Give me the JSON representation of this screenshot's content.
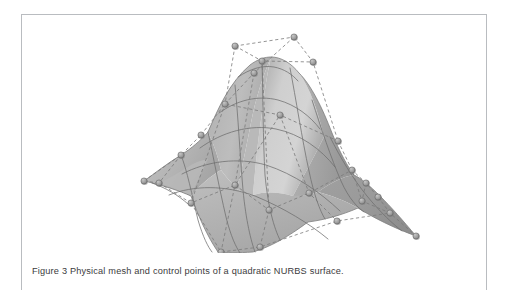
{
  "figure": {
    "caption": "Figure 3 Physical mesh and control points of a quadratic NURBS surface.",
    "label": "Figure 3",
    "border_color": "#b9bcc0",
    "page_background": "#ffffff"
  },
  "surface": {
    "title": "quadratic NURBS surface",
    "fill_light": "#c9c9c9",
    "fill_mid": "#b4b4b4",
    "fill_dark": "#9d9d9d",
    "fill_shadow": "#8f8f8f",
    "physical_mesh_color": "#6e6e6e",
    "control_net_color": "#7a7a7a",
    "control_point_color": "#9a9a9a",
    "control_point_stroke": "#6a6a6a",
    "physical_mesh_style": "solid",
    "control_net_style": "dashed",
    "control_point_count": 25,
    "control_points": [
      {
        "id": "cp-top-left",
        "x": 213,
        "y": 31
      },
      {
        "id": "cp-top-right",
        "x": 272,
        "y": 22
      },
      {
        "id": "cp-peak-mid",
        "x": 240,
        "y": 46
      },
      {
        "id": "cp-upper-right",
        "x": 291,
        "y": 47
      },
      {
        "id": "cp-upper-mid-left",
        "x": 232,
        "y": 58
      },
      {
        "id": "cp-ridge-left",
        "x": 203,
        "y": 89
      },
      {
        "id": "cp-ridge-center",
        "x": 258,
        "y": 100
      },
      {
        "id": "cp-mid-right",
        "x": 316,
        "y": 126
      },
      {
        "id": "cp-mid-left",
        "x": 179,
        "y": 120
      },
      {
        "id": "cp-left-wing-upper",
        "x": 159,
        "y": 140
      },
      {
        "id": "cp-left-tip-a",
        "x": 122,
        "y": 166
      },
      {
        "id": "cp-left-tip-b",
        "x": 137,
        "y": 168
      },
      {
        "id": "cp-left-lower",
        "x": 169,
        "y": 188
      },
      {
        "id": "cp-valley-left",
        "x": 213,
        "y": 170
      },
      {
        "id": "cp-valley-center",
        "x": 247,
        "y": 195
      },
      {
        "id": "cp-valley-right",
        "x": 287,
        "y": 178
      },
      {
        "id": "cp-right-wing-upper",
        "x": 330,
        "y": 155
      },
      {
        "id": "cp-right-wing-mid",
        "x": 344,
        "y": 168
      },
      {
        "id": "cp-right-wing-low",
        "x": 356,
        "y": 182
      },
      {
        "id": "cp-right-lower-a",
        "x": 340,
        "y": 186
      },
      {
        "id": "cp-right-lower-b",
        "x": 368,
        "y": 198
      },
      {
        "id": "cp-right-tip",
        "x": 394,
        "y": 221
      },
      {
        "id": "cp-bottom-left",
        "x": 199,
        "y": 237
      },
      {
        "id": "cp-bottom-mid",
        "x": 238,
        "y": 232
      },
      {
        "id": "cp-bottom-right",
        "x": 315,
        "y": 206
      }
    ]
  }
}
